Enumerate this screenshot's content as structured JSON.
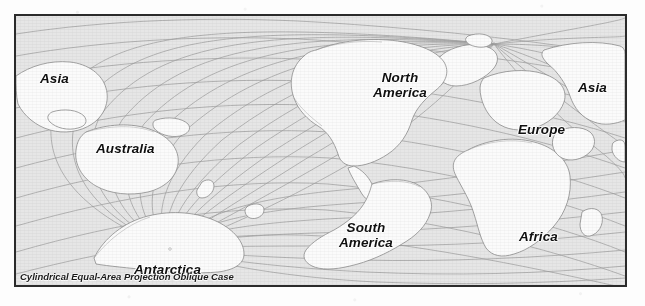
{
  "figure": {
    "caption": "Cylindrical Equal-Area Projection Oblique Case",
    "frame_color": "#2b2b2b",
    "ocean_color": "#e6e6e6",
    "land_color": "#fbfbfb",
    "graticule_color": "#9a9a9a",
    "coastline_color": "#8f8f8f",
    "label_color": "#101010",
    "background_color": "#fdfdfd"
  },
  "map": {
    "projection_name": "Cylindrical Equal-Area Projection",
    "projection_case": "Oblique Case",
    "labels": [
      {
        "id": "asia-west",
        "text": "Asia",
        "x": 24,
        "y": 56,
        "size": "lg"
      },
      {
        "id": "australia",
        "text": "Australia",
        "x": 80,
        "y": 126,
        "size": "lg"
      },
      {
        "id": "north-america",
        "text": "North\nAmerica",
        "x": 357,
        "y": 55,
        "size": "lg"
      },
      {
        "id": "asia-east",
        "text": "Asia",
        "x": 562,
        "y": 65,
        "size": "lg"
      },
      {
        "id": "europe",
        "text": "Europe",
        "x": 502,
        "y": 107,
        "size": "lg"
      },
      {
        "id": "south-america",
        "text": "South\nAmerica",
        "x": 323,
        "y": 205,
        "size": "lg"
      },
      {
        "id": "africa",
        "text": "Africa",
        "x": 503,
        "y": 214,
        "size": "lg"
      },
      {
        "id": "antarctica",
        "text": "Antarctica",
        "x": 118,
        "y": 247,
        "size": "lg"
      }
    ],
    "poles": [
      {
        "id": "north-pole-convergence",
        "x": 478,
        "y": 28
      },
      {
        "id": "south-pole-convergence",
        "x": 154,
        "y": 233
      }
    ]
  }
}
